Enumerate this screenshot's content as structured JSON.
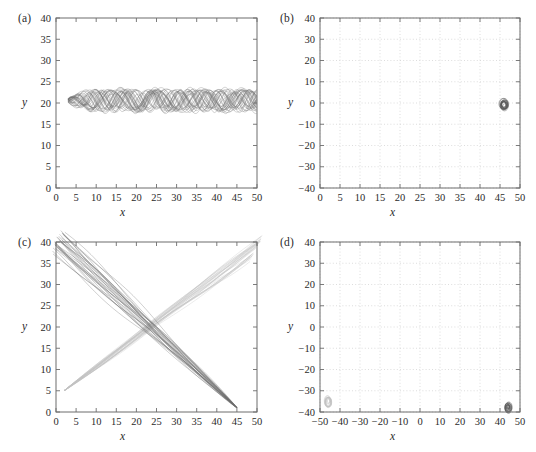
{
  "figure": {
    "panel_count": 4,
    "background": "#ffffff",
    "ink": "#2b2b2b"
  },
  "chart_data": [
    {
      "id": "a",
      "type": "line",
      "label": "(a)",
      "title": "",
      "xlabel": "x",
      "ylabel": "y",
      "xlim": [
        0,
        50
      ],
      "ylim": [
        0,
        40
      ],
      "xticks": [
        0,
        5,
        10,
        15,
        20,
        25,
        30,
        35,
        40,
        45,
        50
      ],
      "yticks": [
        0,
        5,
        10,
        15,
        20,
        25,
        30,
        35,
        40
      ],
      "grid": false,
      "legend": "none",
      "series": [
        {
          "name": "trajectory-bundle-dark",
          "color": "#6f6f6f",
          "description": "dense horizontal bundle of oscillating trajectories",
          "x_start": 3,
          "x_end": 50,
          "y_center": 20.6,
          "y_min": 18.0,
          "y_max": 23.5,
          "strand_count": 34
        }
      ]
    },
    {
      "id": "b",
      "type": "scatter",
      "label": "(b)",
      "title": "",
      "xlabel": "x",
      "ylabel": "y",
      "xlim": [
        0,
        50
      ],
      "ylim": [
        -40,
        40
      ],
      "xticks": [
        0,
        5,
        10,
        15,
        20,
        25,
        30,
        35,
        40,
        45,
        50
      ],
      "yticks": [
        40,
        30,
        20,
        10,
        0,
        -10,
        -20,
        -30,
        -40
      ],
      "grid": true,
      "legend": "none",
      "series": [
        {
          "name": "attractor-blob-dark",
          "color": "#555555",
          "description": "small vertical ring cluster",
          "x": 46,
          "y": -1,
          "rx": 1.1,
          "ry": 2.6,
          "strand_count": 16
        }
      ]
    },
    {
      "id": "c",
      "type": "line",
      "label": "(c)",
      "title": "",
      "xlabel": "x",
      "ylabel": "y",
      "xlim": [
        0,
        50
      ],
      "ylim": [
        0,
        40
      ],
      "xticks": [
        0,
        5,
        10,
        15,
        20,
        25,
        30,
        35,
        40,
        45,
        50
      ],
      "yticks": [
        0,
        5,
        10,
        15,
        20,
        25,
        30,
        35,
        40
      ],
      "grid": false,
      "legend": "none",
      "crossing_point": [
        23,
        19
      ],
      "series": [
        {
          "name": "trajectory-bundle-descending-dark",
          "color": "#6a6a6a",
          "description": "dark bundle from upper-left to lower-right",
          "x_start": 0.5,
          "y_start": 40,
          "x_end": 45,
          "y_end": 1,
          "strand_count": 30
        },
        {
          "name": "trajectory-bundle-ascending-light",
          "color": "#c2c2c2",
          "description": "light bundle from lower-left to upper-right",
          "x_start": 2,
          "y_start": 5,
          "x_end": 50,
          "y_end": 39,
          "strand_count": 30
        }
      ]
    },
    {
      "id": "d",
      "type": "scatter",
      "label": "(d)",
      "title": "",
      "xlabel": "x",
      "ylabel": "y",
      "xlim": [
        -50,
        50
      ],
      "ylim": [
        -40,
        40
      ],
      "xticks": [
        -50,
        -40,
        -30,
        -20,
        -10,
        0,
        10,
        20,
        30,
        40,
        50
      ],
      "yticks": [
        40,
        30,
        20,
        10,
        0,
        -10,
        -20,
        -30,
        -40
      ],
      "grid": true,
      "legend": "none",
      "series": [
        {
          "name": "attractor-blob-light",
          "color": "#bdbdbd",
          "description": "faint ring cluster at lower left",
          "x": -46,
          "y": -35,
          "rx": 1.6,
          "ry": 2.4,
          "strand_count": 12
        },
        {
          "name": "attractor-blob-dark",
          "color": "#5a5a5a",
          "description": "dark ring cluster at lower right",
          "x": 44,
          "y": -38,
          "rx": 1.6,
          "ry": 2.2,
          "strand_count": 16
        }
      ]
    }
  ]
}
